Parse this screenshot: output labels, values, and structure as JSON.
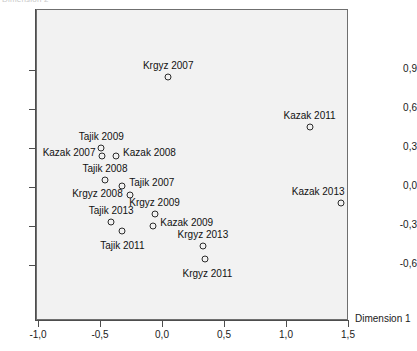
{
  "chart_data": {
    "type": "scatter",
    "title": "",
    "xlabel": "Dimension 1",
    "ylabel": "Dimension 2",
    "xlim": [
      -1.0,
      1.5
    ],
    "ylim": [
      -0.9,
      1.18
    ],
    "grid": false,
    "legend": "none",
    "xticks": [
      "-1,0",
      "-0,5",
      "0,0",
      "0,5",
      "1,0",
      "1,5"
    ],
    "xtick_values": [
      -1.0,
      -0.5,
      0.0,
      0.5,
      1.0,
      1.5
    ],
    "yticks": [
      "0,9",
      "0,6",
      "0,3",
      "0,0",
      "-0,3",
      "-0,6"
    ],
    "ytick_values": [
      0.9,
      0.6,
      0.3,
      0.0,
      -0.3,
      -0.6
    ],
    "points": [
      {
        "label": "Krgyz 2007",
        "x": 0.05,
        "y": 0.85,
        "label_dx": 0,
        "label_dy": -12,
        "anchor": "center"
      },
      {
        "label": "Kazak 2011",
        "x": 1.19,
        "y": 0.46,
        "label_dx": 0,
        "label_dy": -12,
        "anchor": "center"
      },
      {
        "label": "Kazak 2013",
        "x": 1.44,
        "y": -0.12,
        "label_dx": 4,
        "label_dy": -12,
        "anchor": "end"
      },
      {
        "label": "Tajik 2009",
        "x": -0.49,
        "y": 0.3,
        "label_dx": 0,
        "label_dy": -12,
        "anchor": "center"
      },
      {
        "label": "Kazak 2007",
        "x": -0.48,
        "y": 0.235,
        "label_dx": -7,
        "label_dy": -4,
        "anchor": "end"
      },
      {
        "label": "Kazak 2008",
        "x": -0.37,
        "y": 0.235,
        "label_dx": 7,
        "label_dy": -4,
        "anchor": "start"
      },
      {
        "label": "Tajik 2008",
        "x": -0.46,
        "y": 0.055,
        "label_dx": 0,
        "label_dy": -12,
        "anchor": "center"
      },
      {
        "label": "Tajik 2007",
        "x": -0.32,
        "y": 0.01,
        "label_dx": 7,
        "label_dy": -4,
        "anchor": "start"
      },
      {
        "label": "Krgyz 2008",
        "x": -0.26,
        "y": -0.06,
        "label_dx": -7,
        "label_dy": -2,
        "anchor": "end"
      },
      {
        "label": "Krgyz 2009",
        "x": -0.06,
        "y": -0.21,
        "label_dx": 0,
        "label_dy": -12,
        "anchor": "center"
      },
      {
        "label": "Tajik 2013",
        "x": -0.41,
        "y": -0.27,
        "label_dx": 0,
        "label_dy": -12,
        "anchor": "center"
      },
      {
        "label": "Kazak 2009",
        "x": -0.07,
        "y": -0.3,
        "label_dx": 7,
        "label_dy": -4,
        "anchor": "start"
      },
      {
        "label": "Tajik 2011",
        "x": -0.32,
        "y": -0.335,
        "label_dx": 0,
        "label_dy": 14,
        "anchor": "center"
      },
      {
        "label": "Krgyz 2013",
        "x": 0.33,
        "y": -0.45,
        "label_dx": 0,
        "label_dy": -12,
        "anchor": "center"
      },
      {
        "label": "Krgyz 2011",
        "x": 0.35,
        "y": -0.555,
        "label_dx": 2,
        "label_dy": 14,
        "anchor": "center"
      }
    ]
  }
}
